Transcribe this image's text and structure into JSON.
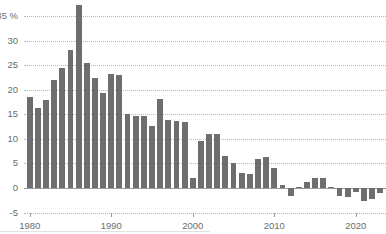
{
  "chart_data": {
    "type": "bar",
    "title": "",
    "subtitle": "",
    "xlabel": "",
    "ylabel": "",
    "unit_label": "%",
    "ylim": [
      -5,
      35
    ],
    "yticks": [
      -5,
      0,
      5,
      10,
      15,
      20,
      25,
      30,
      35
    ],
    "ytick_labels": [
      "-5",
      "0",
      "5",
      "10",
      "15",
      "20",
      "25",
      "30",
      "35 %"
    ],
    "xticks": [
      1980,
      1990,
      2000,
      2010,
      2020
    ],
    "xtick_labels": [
      "1980",
      "1990",
      "2000",
      "2010",
      "2020"
    ],
    "xlim": [
      1979.3,
      2023.7
    ],
    "grid": true,
    "grid_style": "dotted",
    "legend": null,
    "bar_color": "#6e6e6e",
    "grid_color": "#b9b9b9",
    "axis_color": "#9a9a9a",
    "tick_text_color": "#6d6d6d",
    "categories": [
      "1980",
      "1981",
      "1982",
      "1983",
      "1984",
      "1985",
      "1986",
      "1987",
      "1988",
      "1989",
      "1990",
      "1991",
      "1992",
      "1993",
      "1994",
      "1995",
      "1996",
      "1997",
      "1998",
      "1999",
      "2000",
      "2001",
      "2002",
      "2003",
      "2004",
      "2005",
      "2006",
      "2007",
      "2008",
      "2009",
      "2010",
      "2011",
      "2012",
      "2013",
      "2014",
      "2015",
      "2016",
      "2017",
      "2018",
      "2019",
      "2020",
      "2021",
      "2022",
      "2023"
    ],
    "values": [
      18.6,
      16.2,
      18.0,
      21.9,
      24.4,
      28.0,
      37.2,
      25.5,
      22.4,
      19.3,
      23.2,
      23.0,
      15.0,
      14.6,
      14.6,
      12.6,
      18.2,
      13.8,
      13.7,
      13.5,
      2.1,
      9.5,
      11.0,
      11.0,
      6.5,
      5.0,
      3.1,
      2.9,
      5.9,
      6.4,
      4.0,
      0.7,
      -1.7,
      0.2,
      1.3,
      2.0,
      2.0,
      0.3,
      -1.6,
      -1.9,
      -0.8,
      -2.7,
      -2.2,
      -1.0
    ]
  }
}
